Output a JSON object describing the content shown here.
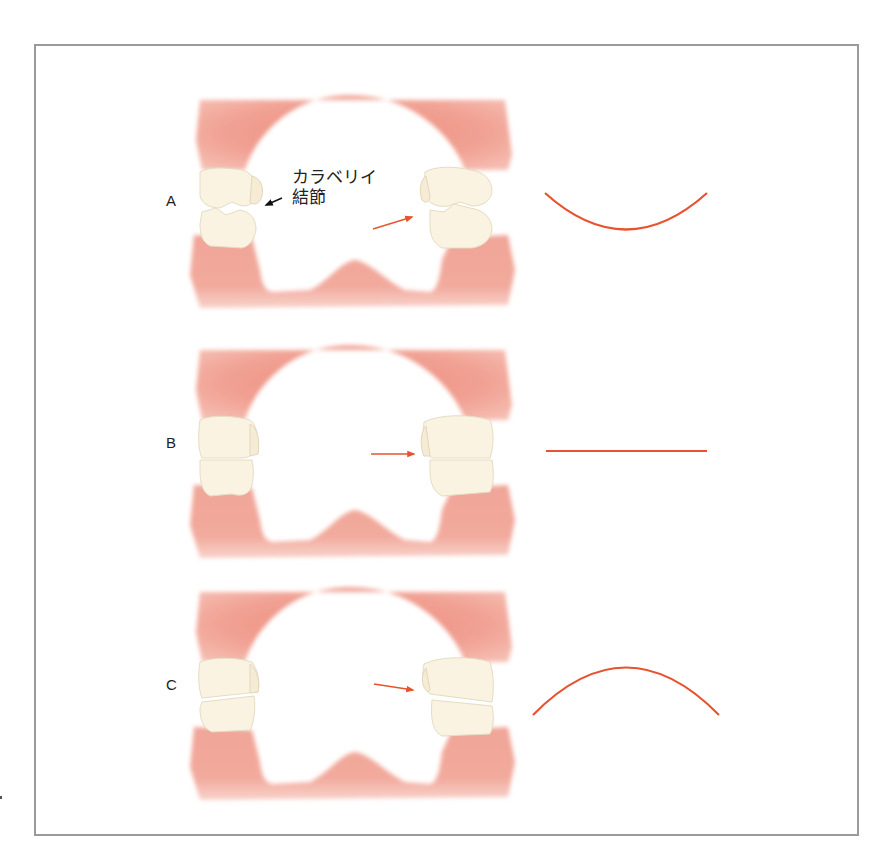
{
  "figure": {
    "panels": [
      {
        "id": "A",
        "label": "A",
        "curve": "concave-up (smile)",
        "arrow_direction": "up-right"
      },
      {
        "id": "B",
        "label": "B",
        "curve": "flat",
        "arrow_direction": "horizontal"
      },
      {
        "id": "C",
        "label": "C",
        "curve": "convex (frown)",
        "arrow_direction": "down-right"
      }
    ],
    "annotation": {
      "line1": "カラベリイ",
      "line2": "結節"
    },
    "colors": {
      "gum": "#f0a698",
      "gum_dark": "#e9887a",
      "tooth": "#faf3e2",
      "tooth_outline": "#e6dcc3",
      "curve": "#e8532f",
      "arrow": "#e8532f",
      "frame": "#9a9a9a"
    }
  }
}
